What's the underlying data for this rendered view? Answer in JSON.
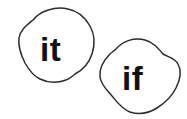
{
  "page": {
    "background_color": "#ffffff",
    "width": 187,
    "height": 119
  },
  "style": {
    "outline_color": "#2b2b2b",
    "outline_width": 1.5,
    "fill_color": "#ffffff",
    "text_color": "#111111"
  },
  "blobs": [
    {
      "id": "blob-it",
      "word": "it",
      "text_x": 40,
      "text_y": 61,
      "font_size": 33,
      "path": "M 33 20 C 40 11, 55 6, 68 9 C 78 11, 85 17, 90 26 C 95 35, 95 45, 92 54 C 89 63, 83 70, 75 74 C 72 76, 70 79, 66 80 C 58 83, 48 83, 40 79 C 33 76, 29 70, 25 63 C 21 55, 18 46, 19 38 C 20 30, 27 25, 33 20 Z"
    },
    {
      "id": "blob-if",
      "word": "if",
      "text_x": 122,
      "text_y": 90,
      "font_size": 33,
      "path": "M 116 49 C 123 41, 134 37, 145 40 C 153 42, 158 48, 163 54 C 168 57, 175 58, 178 64 C 182 71, 180 80, 176 88 C 172 96, 165 103, 157 108 C 149 113, 139 115, 130 112 C 122 109, 117 102, 112 96 C 107 90, 101 85, 100 77 C 99 68, 104 60, 110 54 C 112 52, 114 51, 116 49 Z"
    }
  ]
}
